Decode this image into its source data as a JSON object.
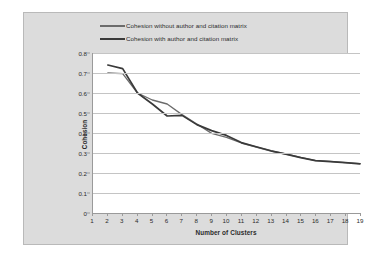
{
  "chart_data": {
    "type": "line",
    "title": "",
    "xlabel": "Number of Clusters",
    "ylabel": "Cohesion",
    "xlim": [
      1,
      19
    ],
    "ylim": [
      0,
      0.8
    ],
    "ytick_step": 0.1,
    "grid": true,
    "legend_position": "top-center",
    "x": [
      1,
      2,
      3,
      4,
      5,
      6,
      7,
      8,
      9,
      10,
      11,
      12,
      13,
      14,
      15,
      16,
      17,
      18,
      19
    ],
    "xticklabels": [
      "1",
      "2",
      "3",
      "4",
      "5",
      "6",
      "7",
      "8",
      "9",
      "10",
      "11",
      "12",
      "13",
      "14",
      "15",
      "16",
      "17",
      "18",
      "19"
    ],
    "yticklabels": [
      "0",
      "0.1",
      "0.2",
      "0.3",
      "0.4",
      "0.5",
      "0.6",
      "0.7",
      "0.8"
    ],
    "series": [
      {
        "name": "Cohesion without author and citation matrix",
        "color": "#6b6b6b",
        "values": [
          null,
          0.7,
          0.697,
          0.6,
          0.565,
          0.545,
          0.492,
          0.445,
          0.398,
          0.378,
          0.35,
          0.33,
          0.31,
          0.295,
          0.278,
          0.262,
          0.258,
          0.252,
          0.247
        ]
      },
      {
        "name": "Cohesion with author and citation matrix",
        "color": "#3a3a3a",
        "values": [
          null,
          0.74,
          0.722,
          0.6,
          0.545,
          0.485,
          0.488,
          0.442,
          0.412,
          0.388,
          0.352,
          0.331,
          0.311,
          0.294,
          0.277,
          0.262,
          0.257,
          0.252,
          0.246
        ]
      }
    ]
  },
  "legend": {
    "entries": [
      {
        "label": "Cohesion without author and citation matrix"
      },
      {
        "label": "Cohesion with author and citation matrix"
      }
    ]
  },
  "colors": {
    "panel_background": "#dcdcdc",
    "plot_background": "#ffffff",
    "gridline": "#c4c4c4",
    "axis": "#9a9a9a",
    "text": "#2b2b2b",
    "series_1": "#6b6b6b",
    "series_2": "#3a3a3a"
  }
}
